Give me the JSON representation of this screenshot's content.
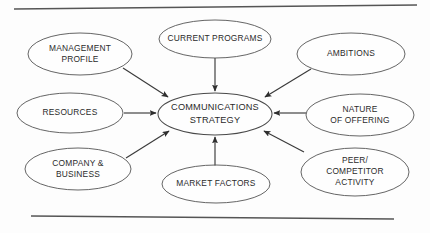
{
  "figure": {
    "type": "hub-and-spoke-diagram",
    "center": {
      "id": "communications-strategy",
      "lines": [
        "COMMUNICATIONS",
        "STRATEGY"
      ],
      "cx": 215,
      "cy": 114,
      "rx": 57,
      "ry": 21,
      "font_size": 9.2
    },
    "nodes": [
      {
        "id": "management-profile",
        "lines": [
          "MANAGEMENT",
          "PROFILE"
        ],
        "cx": 80,
        "cy": 54,
        "rx": 52,
        "ry": 21,
        "font_size": 8.4
      },
      {
        "id": "current-programs",
        "lines": [
          "CURRENT PROGRAMS"
        ],
        "cx": 215,
        "cy": 39,
        "rx": 56,
        "ry": 19,
        "font_size": 8.4
      },
      {
        "id": "ambitions",
        "lines": [
          "AMBITIONS"
        ],
        "cx": 351,
        "cy": 54,
        "rx": 54,
        "ry": 21,
        "font_size": 8.4
      },
      {
        "id": "resources",
        "lines": [
          "RESOURCES"
        ],
        "cx": 70,
        "cy": 113,
        "rx": 53,
        "ry": 20,
        "font_size": 8.4
      },
      {
        "id": "nature-of-offering",
        "lines": [
          "NATURE",
          "OF OFFERING"
        ],
        "cx": 360,
        "cy": 115,
        "rx": 54,
        "ry": 21,
        "font_size": 8.4
      },
      {
        "id": "company-and-business",
        "lines": [
          "COMPANY &",
          "BUSINESS"
        ],
        "cx": 78,
        "cy": 169,
        "rx": 53,
        "ry": 21,
        "font_size": 8.4
      },
      {
        "id": "market-factors",
        "lines": [
          "MARKET FACTORS"
        ],
        "cx": 216,
        "cy": 184,
        "rx": 54,
        "ry": 19,
        "font_size": 8.4
      },
      {
        "id": "peer-competitor-activity",
        "lines": [
          "PEER/",
          "COMPETITOR",
          "ACTIVITY"
        ],
        "cx": 355,
        "cy": 172,
        "rx": 54,
        "ry": 24,
        "font_size": 8.4
      }
    ],
    "arrows": [
      {
        "id": "arrow-management-profile-to-center",
        "from": "management-profile",
        "to": "communications-strategy",
        "x1": 123,
        "y1": 68,
        "x2": 168,
        "y2": 97
      },
      {
        "id": "arrow-current-programs-to-center",
        "from": "current-programs",
        "to": "communications-strategy",
        "x1": 215,
        "y1": 58,
        "x2": 215,
        "y2": 91
      },
      {
        "id": "arrow-ambitions-to-center",
        "from": "ambitions",
        "to": "communications-strategy",
        "x1": 311,
        "y1": 69,
        "x2": 265,
        "y2": 97
      },
      {
        "id": "arrow-resources-to-center",
        "from": "resources",
        "to": "communications-strategy",
        "x1": 124,
        "y1": 113,
        "x2": 156,
        "y2": 113
      },
      {
        "id": "arrow-nature-of-offering-to-center",
        "from": "nature-of-offering",
        "to": "communications-strategy",
        "x1": 306,
        "y1": 113,
        "x2": 274,
        "y2": 113
      },
      {
        "id": "arrow-company-and-business-to-center",
        "from": "company-and-business",
        "to": "communications-strategy",
        "x1": 126,
        "y1": 158,
        "x2": 169,
        "y2": 131
      },
      {
        "id": "arrow-market-factors-to-center",
        "from": "market-factors",
        "to": "communications-strategy",
        "x1": 215,
        "y1": 166,
        "x2": 215,
        "y2": 137
      },
      {
        "id": "arrow-peer-competitor-to-center",
        "from": "peer-competitor-activity",
        "to": "communications-strategy",
        "x1": 304,
        "y1": 152,
        "x2": 264,
        "y2": 131
      }
    ],
    "rules": [
      {
        "id": "top-rule",
        "x1": 14,
        "y1": 9,
        "x2": 417,
        "y2": 5
      },
      {
        "id": "bottom-rule",
        "x1": 31,
        "y1": 216,
        "x2": 394,
        "y2": 219
      }
    ],
    "colors": {
      "background": "#fdfdfd",
      "stroke": "#545454",
      "text": "#2b2b2b",
      "arrow": "#3a3a3a"
    }
  }
}
